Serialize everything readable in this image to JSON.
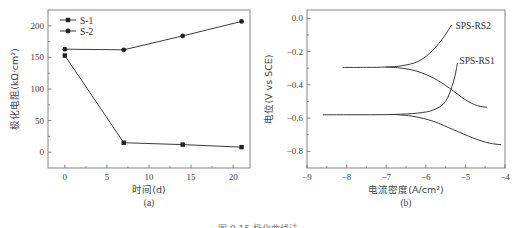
{
  "caption": "图 9.15 极化曲线法",
  "chart_data": [
    {
      "type": "line",
      "panel_label": "(a)",
      "title": "",
      "xlabel": "时间(d)",
      "ylabel": "极化电阻(kΩ·cm²)",
      "xlim": [
        -2,
        22
      ],
      "ylim": [
        -25,
        225
      ],
      "xticks": [
        0,
        5,
        10,
        15,
        20
      ],
      "yticks": [
        0,
        50,
        100,
        150,
        200
      ],
      "grid": false,
      "legend_position": "upper left",
      "x": [
        0,
        7,
        14,
        21
      ],
      "series": [
        {
          "name": "S-1",
          "values": [
            153,
            15,
            12,
            8
          ]
        },
        {
          "name": "S-2",
          "values": [
            163,
            162,
            184,
            207
          ]
        }
      ]
    },
    {
      "type": "line",
      "panel_label": "(b)",
      "title": "",
      "xlabel": "电流密度(A/cm²)",
      "ylabel": "电位(V vs SCE)",
      "xlim": [
        -9,
        -4
      ],
      "ylim": [
        -0.9,
        0.05
      ],
      "xticks": [
        -9,
        -8,
        -7,
        -6,
        -5,
        -4
      ],
      "yticks": [
        0.0,
        -0.2,
        -0.4,
        -0.6,
        -0.8
      ],
      "grid": false,
      "annotations": [
        "SPS-RS2",
        "SPS-RS1"
      ],
      "series": [
        {
          "name": "SPS-RS2 anodic",
          "x": [
            -8.1,
            -7.5,
            -7.0,
            -6.6,
            -6.2,
            -5.9,
            -5.6,
            -5.35
          ],
          "y": [
            -0.295,
            -0.295,
            -0.293,
            -0.285,
            -0.26,
            -0.21,
            -0.13,
            -0.04
          ]
        },
        {
          "name": "SPS-RS2 cathodic",
          "x": [
            -7.0,
            -6.6,
            -6.2,
            -5.8,
            -5.4,
            -5.0,
            -4.7,
            -4.45
          ],
          "y": [
            -0.293,
            -0.3,
            -0.32,
            -0.36,
            -0.42,
            -0.49,
            -0.525,
            -0.535
          ]
        },
        {
          "name": "SPS-RS1 anodic",
          "x": [
            -8.6,
            -8.0,
            -7.4,
            -6.8,
            -6.2,
            -5.8,
            -5.5,
            -5.3,
            -5.2
          ],
          "y": [
            -0.58,
            -0.58,
            -0.58,
            -0.578,
            -0.57,
            -0.55,
            -0.5,
            -0.38,
            -0.27
          ]
        },
        {
          "name": "SPS-RS1 cathodic",
          "x": [
            -6.8,
            -6.3,
            -5.8,
            -5.3,
            -4.8,
            -4.4,
            -4.1
          ],
          "y": [
            -0.578,
            -0.59,
            -0.62,
            -0.67,
            -0.72,
            -0.75,
            -0.76
          ]
        }
      ]
    }
  ]
}
